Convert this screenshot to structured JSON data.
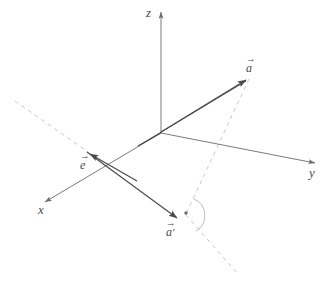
{
  "diagram": {
    "background_color": "#ffffff",
    "stroke_color": "#4a4a4a",
    "axis_color": "#6b6b6b",
    "dashed_color": "#c9c9c9",
    "axes": [
      {
        "name": "z-axis",
        "label": "z",
        "label_x": 148,
        "label_y": 8,
        "from": [
          161,
          133
        ],
        "to": [
          161,
          9
        ],
        "arrow": true,
        "style": "solid"
      },
      {
        "name": "y-axis",
        "label": "y",
        "label_x": 310,
        "label_y": 166,
        "from": [
          161,
          133
        ],
        "to": [
          318,
          164
        ],
        "arrow": true,
        "style": "solid"
      },
      {
        "name": "x-axis",
        "label": "x",
        "label_x": 38,
        "label_y": 204,
        "from": [
          161,
          133
        ],
        "to": [
          42,
          203
        ],
        "arrow": true,
        "style": "solid"
      }
    ],
    "vectors": [
      {
        "name": "vector-a",
        "label": "a",
        "accent": "arrow",
        "prime": false,
        "label_x": 246,
        "label_y": 62,
        "from": [
          161,
          133
        ],
        "to": [
          250,
          77
        ],
        "arrow": true,
        "double": true
      },
      {
        "name": "vector-e",
        "label": "e",
        "accent": "arrow",
        "prime": false,
        "label_x": 79,
        "label_y": 159,
        "from": [
          137,
          181
        ],
        "to": [
          87,
          152
        ],
        "arrow": true,
        "double": false
      },
      {
        "name": "vector-a-prime",
        "label": "a",
        "accent": "arrow",
        "prime": true,
        "label_x": 166,
        "label_y": 226,
        "from": [
          87,
          152
        ],
        "to": [
          180,
          220
        ],
        "arrow": true,
        "double": false
      }
    ],
    "dashed_lines": [
      {
        "name": "dashed-e-extension",
        "from": [
          15,
          101
        ],
        "to": [
          88,
          152
        ]
      },
      {
        "name": "dashed-a-projection",
        "from": [
          249,
          79
        ],
        "to": [
          186,
          214
        ]
      },
      {
        "name": "dashed-a-prime-extension",
        "from": [
          186,
          215
        ],
        "to": [
          238,
          274
        ]
      }
    ],
    "markers": [
      {
        "name": "right-angle-dot",
        "type": "dot",
        "x": 186,
        "y": 213,
        "r": 1.7
      },
      {
        "name": "right-angle-arc",
        "type": "arc",
        "cx": 186,
        "cy": 215,
        "r": 17,
        "start_deg": -62,
        "end_deg": 56
      }
    ]
  }
}
